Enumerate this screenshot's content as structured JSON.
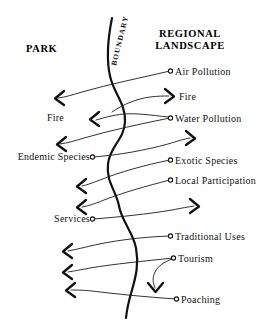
{
  "diagram": {
    "title_left": "PARK",
    "title_right_line1": "REGIONAL",
    "title_right_line2": "LANDSCAPE",
    "boundary_label": "BOUNDARY",
    "ink_color": "#111111",
    "background_color": "#ffffff",
    "left_labels": [
      {
        "id": "fire-left",
        "text": "Fire",
        "x": 64,
        "y": 121
      },
      {
        "id": "endemic-species",
        "text": "Endemic Species",
        "x": 10,
        "y": 160
      },
      {
        "id": "services",
        "text": "Services",
        "x": 55,
        "y": 222
      }
    ],
    "right_labels": [
      {
        "id": "air-pollution",
        "text": "Air Pollution",
        "x": 172,
        "y": 73
      },
      {
        "id": "fire-right",
        "text": "Fire",
        "x": 176,
        "y": 99
      },
      {
        "id": "water-pollution",
        "text": "Water Pollution",
        "x": 172,
        "y": 120
      },
      {
        "id": "exotic-species",
        "text": "Exotic Species",
        "x": 172,
        "y": 162
      },
      {
        "id": "local-participation",
        "text": "Local Participation",
        "x": 172,
        "y": 182
      },
      {
        "id": "traditional-uses",
        "text": "Traditional Uses",
        "x": 172,
        "y": 238
      },
      {
        "id": "tourism",
        "text": "Tourism",
        "x": 176,
        "y": 260
      },
      {
        "id": "poaching",
        "text": "Poaching",
        "x": 180,
        "y": 301
      }
    ],
    "flows": [
      {
        "id": "air-pollution-inflow",
        "from": "Air Pollution",
        "to": "PARK",
        "direction": "left"
      },
      {
        "id": "fire-outflow",
        "from": "PARK",
        "to": "REGIONAL LANDSCAPE",
        "direction": "right"
      },
      {
        "id": "fire-inflow",
        "from": "Fire",
        "to": "PARK",
        "direction": "left"
      },
      {
        "id": "water-pollution-inflow",
        "from": "Water Pollution",
        "to": "PARK",
        "direction": "left"
      },
      {
        "id": "endemic-species-outflow",
        "from": "Endemic Species",
        "to": "REGIONAL LANDSCAPE",
        "direction": "right"
      },
      {
        "id": "exotic-species-inflow",
        "from": "Exotic Species",
        "to": "PARK",
        "direction": "left"
      },
      {
        "id": "local-participation-inflow",
        "from": "Local Participation",
        "to": "PARK",
        "direction": "left"
      },
      {
        "id": "services-outflow",
        "from": "Services",
        "to": "REGIONAL LANDSCAPE",
        "direction": "right"
      },
      {
        "id": "traditional-uses-inflow",
        "from": "Traditional Uses",
        "to": "PARK",
        "direction": "left"
      },
      {
        "id": "tourism-inflow",
        "from": "Tourism",
        "to": "PARK",
        "direction": "left"
      },
      {
        "id": "tourism-downflow",
        "from": "Tourism",
        "to": "boundary",
        "direction": "down"
      },
      {
        "id": "poaching-inflow",
        "from": "Poaching",
        "to": "PARK",
        "direction": "left"
      }
    ]
  }
}
